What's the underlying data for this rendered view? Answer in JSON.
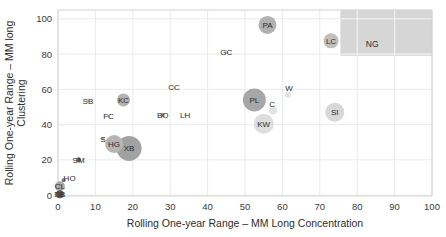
{
  "chart_data": {
    "type": "scatter",
    "title": "",
    "xlabel": "Rolling One-year Range – MM Long Concentration",
    "ylabel_line1": "Rolling One-year Range – MM long",
    "ylabel_line2": "Clustering",
    "xlim": [
      0,
      100
    ],
    "ylim": [
      0,
      100
    ],
    "x_ticks": [
      0,
      10,
      20,
      30,
      40,
      50,
      60,
      70,
      80,
      90,
      100
    ],
    "y_ticks": [
      0,
      20,
      40,
      60,
      80,
      100
    ],
    "grid": true,
    "legend": "none",
    "shaded_region": {
      "label": "NG",
      "x0": 75.5,
      "x1": 100,
      "y0": 79,
      "y1": 105,
      "fill": "#d6d6d6",
      "label_x": 84,
      "label_y": 85.5
    },
    "points": [
      {
        "label": "PA",
        "x": 56,
        "y": 96.5,
        "r": 9,
        "fill": "#b1b1b1"
      },
      {
        "label": "LC",
        "x": 73,
        "y": 87.5,
        "r": 7.5,
        "fill": "#c0c0c0"
      },
      {
        "label": "GC",
        "x": 45,
        "y": 81,
        "r": 2,
        "fill": "#d9d9d9"
      },
      {
        "label": "CC",
        "x": 31,
        "y": 61,
        "r": 1.5,
        "fill": "#dddddd"
      },
      {
        "label": "W",
        "x": 61.5,
        "y": 57,
        "r": 3,
        "fill": "#e3e3e3",
        "label_dx": 1,
        "label_dy": -6
      },
      {
        "label": "SB",
        "x": 8,
        "y": 53.5,
        "r": 1.5,
        "fill": "#cccccc"
      },
      {
        "label": "KC",
        "x": 17.5,
        "y": 54,
        "r": 6.5,
        "fill": "#b3b3b3"
      },
      {
        "label": "FC",
        "x": 13.5,
        "y": 45,
        "r": 1.5,
        "fill": "#d5d5d5"
      },
      {
        "label": "BO",
        "x": 28,
        "y": 45.5,
        "r": 2,
        "fill": "#8a8a8a"
      },
      {
        "label": "LH",
        "x": 34,
        "y": 45.5,
        "r": 1.5,
        "fill": "#dddddd"
      },
      {
        "label": "PL",
        "x": 52.5,
        "y": 54,
        "r": 11.5,
        "fill": "#a7a7a7"
      },
      {
        "label": "C",
        "x": 57.5,
        "y": 48,
        "r": 4,
        "fill": "#e2e2e2",
        "label_dx": -1,
        "label_dy": -6
      },
      {
        "label": "KW",
        "x": 55,
        "y": 40.5,
        "r": 10,
        "fill": "#dedede"
      },
      {
        "label": "SI",
        "x": 74,
        "y": 47,
        "r": 9.5,
        "fill": "#d8d8d8"
      },
      {
        "label": "S",
        "x": 12,
        "y": 32,
        "r": 1.5,
        "fill": "#b0b0b0"
      },
      {
        "label": "HG",
        "x": 15,
        "y": 29,
        "r": 9,
        "fill": "#b5b5b5"
      },
      {
        "label": "XB",
        "x": 19,
        "y": 26.5,
        "r": 12.5,
        "fill": "#a2a2a2"
      },
      {
        "label": "SM",
        "x": 5.5,
        "y": 20,
        "r": 2.5,
        "fill": "#6f6f6f"
      },
      {
        "label": "HO",
        "x": 1.5,
        "y": 8.5,
        "r": 2,
        "fill": "#7a7a7a",
        "label_dx": 6,
        "label_dy": -2
      },
      {
        "label": "CL",
        "x": 0.5,
        "y": 5,
        "r": 5,
        "fill": "#ababab"
      },
      {
        "label": "DB",
        "x": 0.5,
        "y": 0.5,
        "r": 4,
        "fill": "#585858"
      }
    ]
  },
  "colors": {
    "background": "#ffffff",
    "gridline": "#ebebeb",
    "plot_border": "#d2d2d2",
    "tick_text": "#3a3a3a",
    "axis_title_text": "#2e2e2e",
    "point_label_text": "#2b2b2b",
    "shaded_region_fill": "#d6d6d6"
  }
}
